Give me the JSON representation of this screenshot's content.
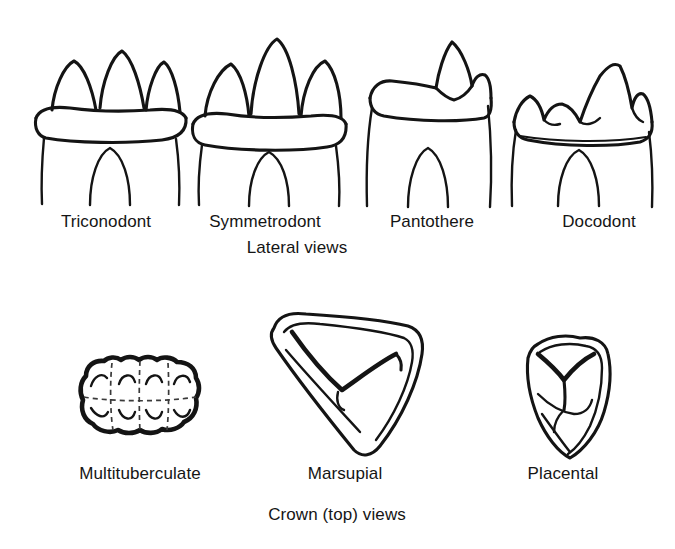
{
  "figure": {
    "background_color": "#ffffff",
    "ink_color": "#141414",
    "style": "black-and-white line drawing"
  },
  "groups": [
    {
      "id": "lateral",
      "caption": "Lateral views",
      "caption_center_x": 297,
      "caption_y": 238,
      "specimens": [
        {
          "name": "Triconodont",
          "label": "Triconodont",
          "label_center_x": 106,
          "label_y": 212,
          "cusp_count": 3,
          "cusp_description": "three similar conical cusps in a row",
          "has_cingulum": true,
          "root_notch": true
        },
        {
          "name": "Symmetrodont",
          "label": "Symmetrodont",
          "label_center_x": 265,
          "label_y": 212,
          "cusp_count": 3,
          "cusp_description": "tall central cusp flanked by two lower cusps",
          "has_cingulum": true,
          "root_notch": true
        },
        {
          "name": "Pantothere",
          "label": "Pantothere",
          "label_center_x": 432,
          "label_y": 212,
          "cusp_count": 2,
          "cusp_description": "one tall cusp with small accessory cusp, broad low crown",
          "has_cingulum": true,
          "root_notch": true
        },
        {
          "name": "Docodont",
          "label": "Docodont",
          "label_center_x": 599,
          "label_y": 212,
          "cusp_count": 5,
          "cusp_description": "multiple irregular cusps, tallest toward the right",
          "has_cingulum": true,
          "root_notch": true
        }
      ]
    },
    {
      "id": "crown",
      "caption": "Crown (top) views",
      "caption_center_x": 337,
      "caption_y": 505,
      "specimens": [
        {
          "name": "Multituberculate",
          "label": "Multituberculate",
          "label_center_x": 140,
          "label_y": 464,
          "cusp_rows": 2,
          "cusps_per_row": 4,
          "cusp_description": "two longitudinal rows of four cusps, dashed cell divisions",
          "outline_shape": "rectangular-lobed"
        },
        {
          "name": "Marsupial",
          "label": "Marsupial",
          "label_center_x": 345,
          "label_y": 464,
          "cusp_rows": 1,
          "cusps_per_row": 3,
          "cusp_description": "triangular crown with V-shaped shearing crest",
          "outline_shape": "triangular"
        },
        {
          "name": "Placental",
          "label": "Placental",
          "label_center_x": 563,
          "label_y": 464,
          "cusp_rows": 1,
          "cusps_per_row": 3,
          "cusp_description": "rounded triangular crown with Y-shaped crest",
          "outline_shape": "rounded-triangular"
        }
      ]
    }
  ]
}
